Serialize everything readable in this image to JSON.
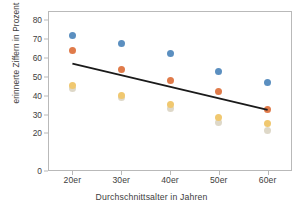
{
  "chart_data": {
    "type": "scatter",
    "title": "",
    "xlabel": "Durchschnittsalter in Jahren",
    "ylabel": "erinnerte Ziffern in Prozent",
    "categories": [
      "20er",
      "30er",
      "40er",
      "50er",
      "60er"
    ],
    "xtick_labels": [
      "20er",
      "30er",
      "40er",
      "50er",
      "60er"
    ],
    "ytick_labels": [
      "0",
      "20",
      "30",
      "40",
      "50",
      "60",
      "70",
      "80"
    ],
    "ytick_values": [
      0,
      20,
      30,
      40,
      50,
      60,
      70,
      80
    ],
    "ylim": [
      0,
      85
    ],
    "grid": false,
    "legend": "none",
    "frame": true,
    "series": [
      {
        "name": "blau",
        "color": "#5b8fc0",
        "values": [
          72.0,
          68.0,
          62.5,
          53.0,
          47.0
        ]
      },
      {
        "name": "orange",
        "color": "#e07b4a",
        "values": [
          63.8,
          53.8,
          48.0,
          42.0,
          32.8
        ]
      },
      {
        "name": "gelb",
        "color": "#f0c870",
        "values": [
          45.2,
          40.2,
          35.2,
          28.2,
          25.2
        ]
      },
      {
        "name": "hellgrau-beige",
        "color": "#ded8c8",
        "values": [
          44.0,
          39.0,
          33.2,
          26.0,
          21.5
        ]
      }
    ],
    "trendline": {
      "color": "#1a1a1a",
      "x_start_category": "20er",
      "x_end_category": "60er",
      "y_start": 57.0,
      "y_end": 32.5
    }
  }
}
